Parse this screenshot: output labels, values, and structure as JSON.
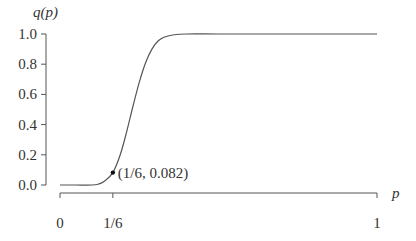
{
  "chart_data": {
    "type": "line",
    "title": "",
    "xlabel": "p",
    "ylabel": "q(p)",
    "xlim": [
      0,
      1
    ],
    "ylim": [
      0,
      1
    ],
    "grid": false,
    "legend": null,
    "x_ticks": [
      {
        "value": 0,
        "label": "0"
      },
      {
        "value": 0.1667,
        "label": "1/6"
      },
      {
        "value": 1,
        "label": "1"
      }
    ],
    "y_ticks": [
      {
        "value": 0.0,
        "label": "0.0"
      },
      {
        "value": 0.2,
        "label": "0.2"
      },
      {
        "value": 0.4,
        "label": "0.4"
      },
      {
        "value": 0.6,
        "label": "0.6"
      },
      {
        "value": 0.8,
        "label": "0.8"
      },
      {
        "value": 1.0,
        "label": "1.0"
      }
    ],
    "series": [
      {
        "name": "q(p)",
        "color": "#555555",
        "x": [
          0,
          0.05,
          0.1,
          0.12,
          0.14,
          0.1667,
          0.19,
          0.21,
          0.23,
          0.25,
          0.27,
          0.29,
          0.31,
          0.33,
          0.36,
          0.4,
          0.5,
          0.7,
          1.0
        ],
        "y": [
          0.0,
          0.0,
          0.0,
          0.005,
          0.025,
          0.082,
          0.2,
          0.35,
          0.52,
          0.68,
          0.81,
          0.9,
          0.955,
          0.98,
          0.995,
          1.0,
          1.0,
          1.0,
          1.0
        ]
      }
    ],
    "annotations": [
      {
        "x": 0.1667,
        "y": 0.082,
        "text": "(1/6, 0.082)",
        "marker": "dot"
      }
    ]
  }
}
